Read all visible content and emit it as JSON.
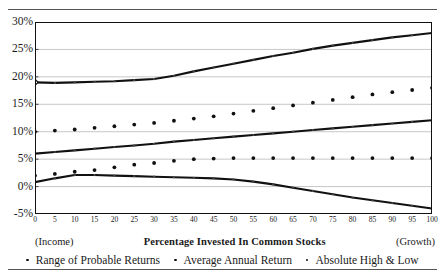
{
  "figure": {
    "top_rule": "",
    "bottom_rule": ""
  },
  "axis": {
    "x_title": "Percentage Invested In Common Stocks",
    "left_paren": "(Income)",
    "right_paren": "(Growth)",
    "y_ticks": [
      "30%",
      "25%",
      "20%",
      "15%",
      "10%",
      "5%",
      "0%",
      "-5%"
    ],
    "x_ticks": [
      "0",
      "5",
      "10",
      "15",
      "20",
      "25",
      "30",
      "35",
      "40",
      "45",
      "50",
      "55",
      "60",
      "65",
      "70",
      "75",
      "80",
      "85",
      "90",
      "95",
      "100"
    ]
  },
  "legend": {
    "items": [
      {
        "label": "Range of Probable Returns",
        "marker": "dot-icon"
      },
      {
        "label": "Average Annual Return",
        "marker": "dot-icon"
      },
      {
        "label": "Absolute High & Low",
        "marker": "dot-icon"
      }
    ]
  },
  "colors": {
    "line": "#111111",
    "grid": "#b9b9b9",
    "border": "#111111",
    "text": "#1a1a1a"
  },
  "chart_data": {
    "type": "line",
    "title": "",
    "xlabel": "Percentage Invested In Common Stocks",
    "ylabel": "",
    "xlim": [
      0,
      100
    ],
    "ylim": [
      -5,
      30
    ],
    "grid": true,
    "legend_position": "bottom",
    "x": [
      0,
      5,
      10,
      15,
      20,
      25,
      30,
      35,
      40,
      45,
      50,
      55,
      60,
      65,
      70,
      75,
      80,
      85,
      90,
      95,
      100
    ],
    "series": [
      {
        "name": "Absolute High & Low",
        "role": "upper-markers",
        "style": "markers",
        "values": [
          10.0,
          10.2,
          10.4,
          10.7,
          11.0,
          11.3,
          11.6,
          12.0,
          12.4,
          12.8,
          13.3,
          13.8,
          14.3,
          14.8,
          15.3,
          15.8,
          16.3,
          16.8,
          17.2,
          17.6,
          18.0
        ]
      },
      {
        "name": "Range of Probable Returns",
        "role": "upper-band-line",
        "style": "line-with-markers",
        "values": [
          19.0,
          18.9,
          19.0,
          19.1,
          19.2,
          19.4,
          19.6,
          20.2,
          21.0,
          21.7,
          22.4,
          23.1,
          23.8,
          24.4,
          25.1,
          25.7,
          26.2,
          26.7,
          27.2,
          27.6,
          28.0
        ]
      },
      {
        "name": "Average Annual Return",
        "role": "mid-line",
        "style": "line-with-markers",
        "values": [
          6.0,
          6.3,
          6.6,
          6.9,
          7.2,
          7.5,
          7.8,
          8.2,
          8.5,
          8.8,
          9.1,
          9.4,
          9.7,
          10.0,
          10.3,
          10.6,
          10.9,
          11.2,
          11.5,
          11.8,
          12.1
        ]
      },
      {
        "name": "Absolute High & Low",
        "role": "lower-markers",
        "style": "markers",
        "values": [
          2.0,
          2.3,
          2.7,
          3.0,
          3.5,
          4.0,
          4.3,
          4.7,
          5.0,
          5.1,
          5.2,
          5.2,
          5.2,
          5.2,
          5.2,
          5.2,
          5.2,
          5.2,
          5.2,
          5.2,
          5.2
        ]
      },
      {
        "name": "Range of Probable Returns",
        "role": "lower-band-line",
        "style": "line-with-markers",
        "values": [
          0.8,
          1.5,
          2.1,
          2.1,
          2.0,
          1.9,
          1.8,
          1.7,
          1.6,
          1.5,
          1.3,
          0.9,
          0.4,
          -0.2,
          -0.8,
          -1.4,
          -2.0,
          -2.5,
          -3.0,
          -3.5,
          -4.0
        ]
      }
    ]
  }
}
